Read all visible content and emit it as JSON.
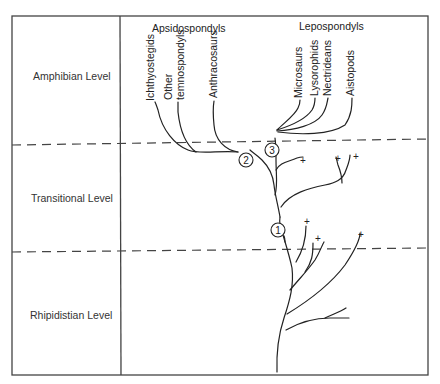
{
  "levels": [
    {
      "label": "Amphibian Level"
    },
    {
      "label": "Transitional Level"
    },
    {
      "label": "Rhipidistian Level"
    }
  ],
  "groups": {
    "apsidospondyls": {
      "label": "Apsidospondyls",
      "taxa": [
        "Ichthyostegids",
        "Other",
        "temnospondyls",
        "Anthracosaurs"
      ]
    },
    "lepospondyls": {
      "label": "Lepospondyls",
      "taxa": [
        "Microsaurs",
        "Lysorophids",
        "Nectrideans",
        "Aistopods"
      ]
    }
  },
  "nodes": [
    "1",
    "2",
    "3"
  ],
  "extinction_marker": "+"
}
